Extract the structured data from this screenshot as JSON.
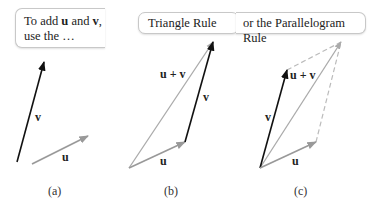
{
  "figure": {
    "panels": [
      {
        "id": "a",
        "caption": "(a)",
        "callout": {
          "prefix": "To add ",
          "u": "u",
          "and": " and ",
          "v": "v",
          "suffix": ",",
          "line2": "use the …"
        },
        "labels": {
          "u": "u",
          "v": "v"
        }
      },
      {
        "id": "b",
        "caption": "(b)",
        "callout": {
          "text": "Triangle Rule"
        },
        "labels": {
          "u": "u",
          "v": "v",
          "sum": "u + v"
        }
      },
      {
        "id": "c",
        "caption": "(c)",
        "callout": {
          "text": "or the Parallelogram Rule"
        },
        "labels": {
          "u": "u",
          "v": "v",
          "sum": "u + v"
        }
      }
    ],
    "colors": {
      "v_vector": "#111111",
      "u_vector": "#999999",
      "sum_vector": "#aaaaaa",
      "dashed": "#bbbbbb"
    }
  }
}
